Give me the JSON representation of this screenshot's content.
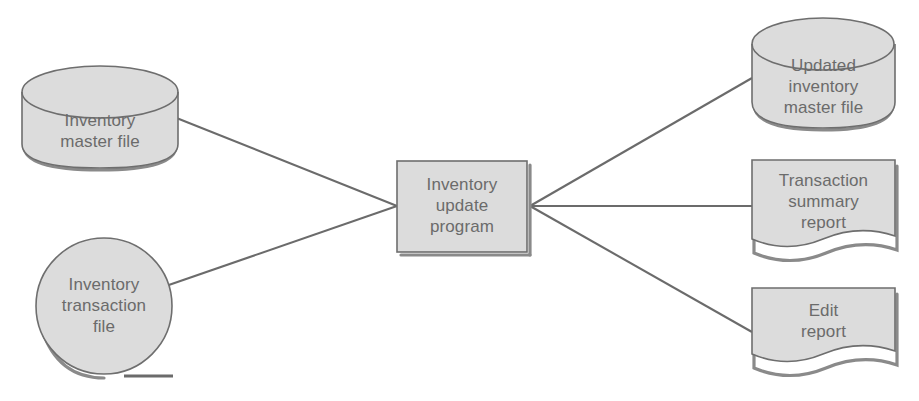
{
  "diagram": {
    "colors": {
      "shape_fill": "#dcdcdc",
      "shape_stroke": "#6e6e6e",
      "shadow": "#8a8a8a",
      "connector": "#6b6b6b",
      "text": "#6b6b6b",
      "background": "#ffffff"
    },
    "nodes": [
      {
        "id": "inventory-master-file",
        "shape": "cylinder",
        "role": "input",
        "lines": [
          "Inventory",
          "master file"
        ],
        "text": "Inventory\nmaster file",
        "x": 22,
        "y": 66,
        "width": 156,
        "height": 102
      },
      {
        "id": "inventory-transaction-file",
        "shape": "magnetic-tape",
        "role": "input",
        "lines": [
          "Inventory",
          "transaction",
          "file"
        ],
        "text": "Inventory\ntransaction\nfile",
        "x": 36,
        "y": 237,
        "width": 136,
        "height": 139
      },
      {
        "id": "inventory-update-program",
        "shape": "process",
        "role": "process",
        "lines": [
          "Inventory",
          "update",
          "program"
        ],
        "text": "Inventory\nupdate\nprogram",
        "x": 397,
        "y": 161,
        "width": 130,
        "height": 91
      },
      {
        "id": "updated-inventory-master-file",
        "shape": "cylinder",
        "role": "output",
        "lines": [
          "Updated",
          "inventory",
          "master file"
        ],
        "text": "Updated\ninventory\nmaster file",
        "x": 752,
        "y": 18,
        "width": 143,
        "height": 110
      },
      {
        "id": "transaction-summary-report",
        "shape": "document",
        "role": "output",
        "lines": [
          "Transaction",
          "summary",
          "report"
        ],
        "text": "Transaction\nsummary\nreport",
        "x": 752,
        "y": 160,
        "width": 143,
        "height": 90
      },
      {
        "id": "edit-report",
        "shape": "document",
        "role": "output",
        "lines": [
          "Edit",
          "report"
        ],
        "text": "Edit\nreport",
        "x": 752,
        "y": 288,
        "width": 143,
        "height": 77
      }
    ],
    "connectors": [
      {
        "id": "master-file-to-program",
        "from": "inventory-master-file",
        "to": "inventory-update-program"
      },
      {
        "id": "transaction-file-to-program",
        "from": "inventory-transaction-file",
        "to": "inventory-update-program"
      },
      {
        "id": "program-to-updated-master-file",
        "from": "inventory-update-program",
        "to": "updated-inventory-master-file"
      },
      {
        "id": "program-to-transaction-summary-report",
        "from": "inventory-update-program",
        "to": "transaction-summary-report"
      },
      {
        "id": "program-to-edit-report",
        "from": "inventory-update-program",
        "to": "edit-report"
      }
    ]
  }
}
